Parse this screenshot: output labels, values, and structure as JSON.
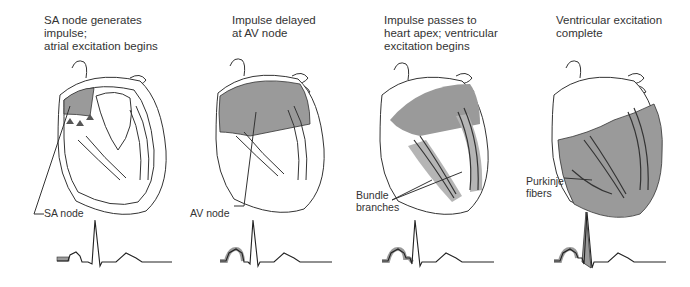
{
  "figure": {
    "colors": {
      "excited_tissue": "#9a9a9a",
      "outline": "#333333",
      "background": "#ffffff"
    },
    "panels": [
      {
        "caption": "SA node generates impulse;\natrial excitation begins",
        "label": "SA node",
        "ecg_highlight": "P wave onset"
      },
      {
        "caption": "Impulse delayed\nat AV node",
        "label": "AV node",
        "ecg_highlight": "P wave"
      },
      {
        "caption": "Impulse passes to\nheart apex; ventricular\nexcitation begins",
        "label": "Bundle\nbranches",
        "ecg_highlight": "P wave + PR segment"
      },
      {
        "caption": "Ventricular excitation\ncomplete",
        "label": "Purkinje\nfibers",
        "ecg_highlight": "P wave + QRS complex"
      }
    ]
  }
}
